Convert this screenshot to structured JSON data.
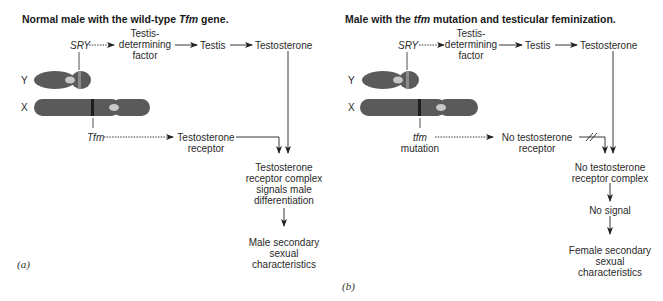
{
  "panels": [
    {
      "id": "a",
      "label": "(a)",
      "title_pre": "Normal male with the wild-type ",
      "title_gene": "Tfm",
      "title_post": " gene.",
      "sry": "SRY",
      "tdf": [
        "Testis-",
        "determining",
        "factor"
      ],
      "testis": "Testis",
      "testosterone": "Testosterone",
      "chrom_y": "Y",
      "chrom_x": "X",
      "gene": "Tfm",
      "gene_sub": "",
      "receptor": [
        "Testosterone",
        "receptor"
      ],
      "complex": [
        "Testosterone",
        "receptor complex",
        "signals male",
        "differentiation"
      ],
      "signal": "",
      "outcome": [
        "Male secondary",
        "sexual",
        "characteristics"
      ],
      "receptor_blocked": false
    },
    {
      "id": "b",
      "label": "(b)",
      "title_pre": "Male with the ",
      "title_gene": "tfm",
      "title_post": " mutation and testicular feminization.",
      "sry": "SRY",
      "tdf": [
        "Testis-",
        "determining",
        "factor"
      ],
      "testis": "Testis",
      "testosterone": "Testosterone",
      "chrom_y": "Y",
      "chrom_x": "X",
      "gene": "tfm",
      "gene_sub": "mutation",
      "receptor": [
        "No testosterone",
        "receptor"
      ],
      "complex": [
        "No testosterone",
        "receptor complex"
      ],
      "signal": "No signal",
      "outcome": [
        "Female secondary",
        "sexual",
        "characteristics"
      ],
      "receptor_blocked": true
    }
  ],
  "colors": {
    "chromosome": "#5a5a5a",
    "centromere": "#c8c8c8",
    "sry_band": "#8a8a8a",
    "tfm_band": "#1e1e1e",
    "line": "#222222"
  }
}
